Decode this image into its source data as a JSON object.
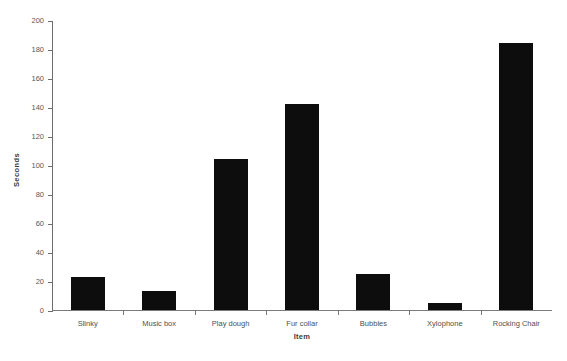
{
  "chart_data": {
    "type": "bar",
    "title": "",
    "subtitle": "",
    "xlabel": "Item",
    "ylabel": "Seconds",
    "categories": [
      "Slinky",
      "Music box",
      "Play dough",
      "Fur collar",
      "Bubbles",
      "Xylophone",
      "Rocking Chair"
    ],
    "values": [
      23,
      13,
      104,
      142,
      25,
      5,
      184
    ],
    "ylim": [
      0,
      200
    ],
    "yticks": [
      0,
      20,
      40,
      60,
      80,
      100,
      120,
      140,
      160,
      180,
      200
    ],
    "ytick_labels": [
      "0",
      "20",
      "40",
      "60",
      "80",
      "100",
      "120",
      "140",
      "160",
      "180",
      "200"
    ],
    "grid": false,
    "legend": null,
    "bar_color": "#0d0d0d",
    "axis_color": "#6d6d6d",
    "background_color": "#ffffff"
  },
  "axes": {
    "y_title": "Seconds",
    "x_title": "Item"
  }
}
